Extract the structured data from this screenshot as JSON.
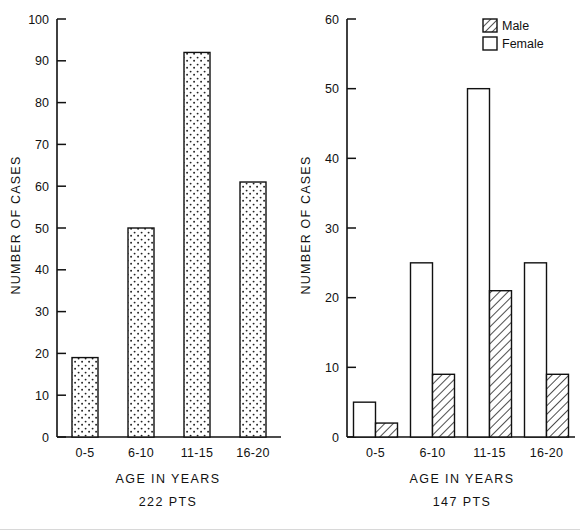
{
  "figure": {
    "background": "#ffffff",
    "ink": "#111111"
  },
  "chart_data": [
    {
      "id": "left",
      "type": "bar",
      "title": "",
      "xlabel": "AGE IN YEARS",
      "caption": "222 PTS",
      "ylabel": "NUMBER OF CASES",
      "categories": [
        "0-5",
        "6-10",
        "11-15",
        "16-20"
      ],
      "values": [
        19,
        50,
        92,
        61
      ],
      "ylim": [
        0,
        100
      ],
      "yticks": [
        0,
        10,
        20,
        30,
        40,
        50,
        60,
        70,
        80,
        90,
        100
      ],
      "ytick_labels": [
        "0",
        "10",
        "20",
        "30",
        "40",
        "50",
        "60",
        "70",
        "80",
        "90",
        "100"
      ],
      "grid": false,
      "legend": null,
      "fill_pattern": "dotted",
      "series": [
        {
          "name": "All cases",
          "pattern": "dotted",
          "values": [
            19,
            50,
            92,
            61
          ]
        }
      ]
    },
    {
      "id": "right",
      "type": "bar",
      "title": "",
      "xlabel": "AGE IN YEARS",
      "caption": "147 PTS",
      "ylabel": "NUMBER OF CASES",
      "categories": [
        "0-5",
        "6-10",
        "11-15",
        "16-20"
      ],
      "ylim": [
        0,
        60
      ],
      "yticks": [
        0,
        10,
        20,
        30,
        40,
        50,
        60
      ],
      "ytick_labels": [
        "0",
        "10",
        "20",
        "30",
        "40",
        "50",
        "60"
      ],
      "grid": false,
      "legend": {
        "position": "top-right",
        "entries": [
          "Male",
          "Female"
        ]
      },
      "series": [
        {
          "name": "Female",
          "pattern": "empty",
          "values": [
            5,
            25,
            50,
            25
          ]
        },
        {
          "name": "Male",
          "pattern": "hatched",
          "values": [
            2,
            9,
            21,
            9
          ]
        }
      ]
    }
  ],
  "legend": {
    "male_label": "Male",
    "female_label": "Female"
  },
  "left_chart": {
    "ylabel": "NUMBER OF CASES",
    "xlabel": "AGE IN YEARS",
    "caption": "222 PTS",
    "ytick_labels": [
      "0",
      "10",
      "20",
      "30",
      "40",
      "50",
      "60",
      "70",
      "80",
      "90",
      "100"
    ],
    "categories": [
      "0-5",
      "6-10",
      "11-15",
      "16-20"
    ]
  },
  "right_chart": {
    "ylabel": "NUMBER OF CASES",
    "xlabel": "AGE IN YEARS",
    "caption": "147 PTS",
    "ytick_labels": [
      "0",
      "10",
      "20",
      "30",
      "40",
      "50",
      "60"
    ],
    "categories": [
      "0-5",
      "6-10",
      "11-15",
      "16-20"
    ]
  }
}
